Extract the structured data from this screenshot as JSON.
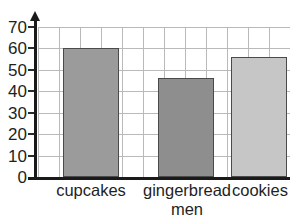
{
  "chart_data": {
    "type": "bar",
    "title": "",
    "subtitle": "",
    "xlabel": "",
    "ylabel": "",
    "categories": [
      "cupcakes",
      "gingerbread men",
      "cookies"
    ],
    "category_lines": [
      [
        "cupcakes"
      ],
      [
        "gingerbread",
        "men"
      ],
      [
        "cookies"
      ]
    ],
    "values": [
      60,
      46,
      56
    ],
    "ylim": [
      0,
      70
    ],
    "ytick_labels": [
      "0",
      "10",
      "20",
      "30",
      "40",
      "50",
      "60",
      "70"
    ],
    "ytick_values": [
      0,
      10,
      20,
      30,
      40,
      50,
      60,
      70
    ],
    "ytick_step": 10,
    "grid": "both",
    "legend": "none",
    "bar_colors": [
      "#9b9b9b",
      "#8e8e8e",
      "#c6c6c6"
    ],
    "bar_edge_color": "#4a4a4a",
    "grid_color": "#b9b9b9",
    "axis_color": "#1a1a1a",
    "text_color": "#221f1f",
    "background": "#ffffff",
    "y_axis_arrow": true,
    "vertical_gridline_count": 12
  },
  "cropped_text": {
    "top": "",
    "bottom": ""
  }
}
